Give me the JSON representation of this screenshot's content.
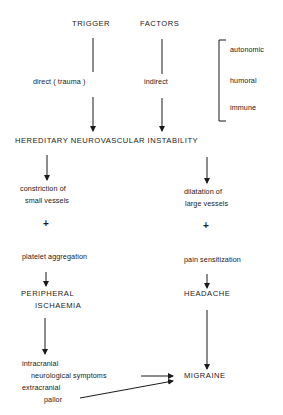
{
  "diagram": {
    "header": {
      "left": "TRIGGER",
      "right": "FACTORS"
    },
    "trigger_types": {
      "direct": "direct ( trauma )",
      "indirect": "indirect"
    },
    "indirect_factors": [
      "autonomic",
      "humoral",
      "immune"
    ],
    "central_node": "HEREDITARY NEUROVASCULAR INSTABILITY",
    "left_branch": {
      "step1_line1": "constriction of",
      "step1_line2": "small vessels",
      "plus": "+",
      "step2": "platelet aggregation",
      "outcome_line1": "PERIPHERAL",
      "outcome_line2": "ISCHAEMIA",
      "sym1": "intracranial",
      "sym2": "neurological symptoms",
      "sym3": "extracranial",
      "sym4": "pallor"
    },
    "right_branch": {
      "step1_line1": "dilatation of",
      "step1_line2": "large vessels",
      "plus": "+",
      "step2": "pain sensitization",
      "outcome": "HEADACHE"
    },
    "final_node": "MIGRAINE",
    "colors": {
      "ink": "#1a1a1a",
      "background": "#ffffff"
    }
  }
}
